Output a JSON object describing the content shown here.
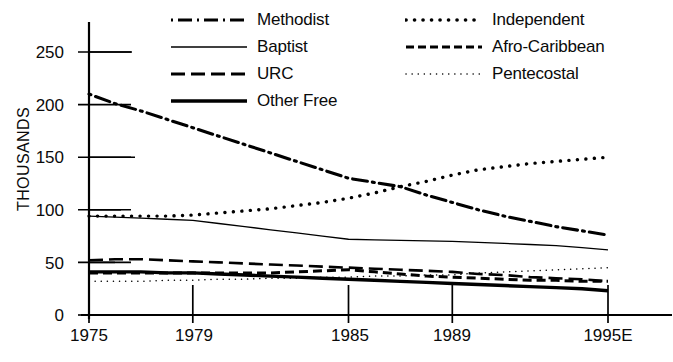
{
  "chart_data": {
    "type": "line",
    "title": "",
    "xlabel": "",
    "ylabel": "THOUSANDS",
    "x_tick_labels": [
      "1975",
      "1979",
      "1985",
      "1989",
      "1995E"
    ],
    "x_tick_values": [
      1975,
      1979,
      1985,
      1989,
      1995
    ],
    "xlim": [
      1975,
      1996
    ],
    "y_tick_labels": [
      "0",
      "50",
      "100",
      "150",
      "200",
      "250"
    ],
    "y_tick_values": [
      0,
      50,
      100,
      150,
      200,
      250
    ],
    "ylim": [
      0,
      265
    ],
    "grid": false,
    "legend_position": "top-center",
    "units": "thousands",
    "x": [
      1975,
      1976,
      1977,
      1978,
      1979,
      1980,
      1981,
      1982,
      1983,
      1984,
      1985,
      1986,
      1987,
      1988,
      1989,
      1990,
      1991,
      1992,
      1993,
      1994,
      1995
    ],
    "series": [
      {
        "name": "Methodist",
        "style": "dash-dot",
        "color": "#000000",
        "width": 3.1,
        "values": [
          210,
          201,
          194,
          186,
          178,
          170,
          162,
          154,
          146,
          138,
          130,
          126,
          122,
          114,
          107,
          100,
          94,
          89,
          84,
          80,
          76
        ]
      },
      {
        "name": "Baptist",
        "style": "solid-thin",
        "color": "#000000",
        "width": 1.3,
        "values": [
          94,
          93,
          92,
          91,
          90,
          87,
          84,
          81,
          78,
          75,
          72,
          71.5,
          71,
          70.5,
          70,
          69,
          68,
          67,
          66,
          64,
          62
        ]
      },
      {
        "name": "URC",
        "style": "long-dash",
        "color": "#000000",
        "width": 2.6,
        "values": [
          52,
          53,
          53,
          52,
          51,
          50,
          49,
          48,
          47,
          46,
          45,
          44,
          43,
          42,
          41,
          39,
          38,
          36,
          35,
          34,
          32
        ]
      },
      {
        "name": "Independent",
        "style": "dotted-thick",
        "color": "#000000",
        "width": 3.4,
        "values": [
          94,
          94,
          94,
          94,
          95,
          97,
          99,
          101,
          104,
          107,
          111,
          116,
          122,
          127,
          133,
          138,
          141,
          144,
          146,
          148,
          150
        ]
      },
      {
        "name": "Afro-Caribbean",
        "style": "dashed",
        "color": "#000000",
        "width": 3.0,
        "values": [
          40,
          40,
          40,
          40,
          40,
          40,
          40,
          40,
          41,
          42,
          43,
          41,
          39,
          37,
          36,
          35,
          34,
          33,
          33,
          32,
          32
        ]
      },
      {
        "name": "Pentecostal",
        "style": "dotted-fine",
        "color": "#000000",
        "width": 1.5,
        "values": [
          32,
          32,
          32,
          33,
          33,
          34,
          34,
          35,
          35,
          36,
          36,
          37,
          37,
          38,
          38,
          40,
          41,
          42,
          43,
          44,
          45
        ]
      },
      {
        "name": "Other Free",
        "style": "solid-thick",
        "color": "#000000",
        "width": 3.4,
        "values": [
          41,
          41,
          41,
          40,
          40,
          39,
          38,
          37,
          36,
          35,
          34,
          33,
          32,
          31,
          30,
          29,
          28,
          27,
          26,
          25,
          23
        ]
      }
    ]
  },
  "legend": {
    "items": [
      {
        "label": "Methodist",
        "key": "line-key-dash-dot"
      },
      {
        "label": "Independent",
        "key": "line-key-dotted-thick"
      },
      {
        "label": "Baptist",
        "key": "line-key-solid-thin"
      },
      {
        "label": "Afro-Caribbean",
        "key": "line-key-dashed"
      },
      {
        "label": "URC",
        "key": "line-key-long-dash"
      },
      {
        "label": "Pentecostal",
        "key": "line-key-dotted-fine"
      },
      {
        "label": "Other Free",
        "key": "line-key-solid-thick"
      }
    ]
  },
  "axes": {
    "y_axis_title": "THOUSANDS",
    "y_ticks": [
      "250",
      "200",
      "150",
      "100",
      "50",
      "0"
    ],
    "x_ticks": [
      "1975",
      "1979",
      "1985",
      "1989",
      "1995E"
    ]
  }
}
